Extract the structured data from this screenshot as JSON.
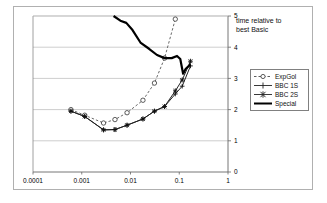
{
  "chart_title_line1": "time relative to",
  "chart_title_line2": "best Basic",
  "legend": {
    "items": [
      {
        "label": "ExpGol",
        "key": "dashed-circle-key"
      },
      {
        "label": "BBC 1S",
        "key": "solid-plus-key"
      },
      {
        "label": "BBC 2S",
        "key": "solid-star-key"
      },
      {
        "label": "Special",
        "key": "thick-solid-key"
      }
    ]
  },
  "axes": {
    "x_ticks": [
      "0.0001",
      "0.001",
      "0.01",
      "0.1",
      "1"
    ],
    "y_ticks": [
      "0",
      "1",
      "2",
      "3",
      "4",
      "5"
    ]
  },
  "chart_data": {
    "type": "line",
    "title": "time relative to best Basic",
    "xlabel": "",
    "ylabel": "",
    "xscale": "log",
    "xlim": [
      0.0001,
      1
    ],
    "ylim": [
      0,
      5
    ],
    "grid": true,
    "legend_position": "right",
    "xticks": [
      0.0001,
      0.001,
      0.01,
      0.1,
      1
    ],
    "yticks": [
      0,
      1,
      2,
      3,
      4,
      5
    ],
    "series": [
      {
        "name": "ExpGol",
        "style": "dashed",
        "marker": "circle",
        "points": [
          {
            "x": 0.0006,
            "y": 2.0
          },
          {
            "x": 0.00115,
            "y": 1.82
          },
          {
            "x": 0.0028,
            "y": 1.57
          },
          {
            "x": 0.0048,
            "y": 1.68
          },
          {
            "x": 0.0085,
            "y": 1.9
          },
          {
            "x": 0.018,
            "y": 2.3
          },
          {
            "x": 0.031,
            "y": 2.85
          },
          {
            "x": 0.05,
            "y": 3.65
          },
          {
            "x": 0.083,
            "y": 4.9
          }
        ]
      },
      {
        "name": "BBC 1S",
        "style": "solid",
        "marker": "plus",
        "points": [
          {
            "x": 0.0006,
            "y": 1.95
          },
          {
            "x": 0.00115,
            "y": 1.78
          },
          {
            "x": 0.0028,
            "y": 1.35
          },
          {
            "x": 0.0048,
            "y": 1.36
          },
          {
            "x": 0.0085,
            "y": 1.5
          },
          {
            "x": 0.018,
            "y": 1.7
          },
          {
            "x": 0.031,
            "y": 1.95
          },
          {
            "x": 0.05,
            "y": 2.1
          },
          {
            "x": 0.083,
            "y": 2.5
          },
          {
            "x": 0.115,
            "y": 2.75
          },
          {
            "x": 0.17,
            "y": 3.4
          }
        ]
      },
      {
        "name": "BBC 2S",
        "style": "solid",
        "marker": "star",
        "points": [
          {
            "x": 0.0006,
            "y": 1.95
          },
          {
            "x": 0.00115,
            "y": 1.78
          },
          {
            "x": 0.0028,
            "y": 1.35
          },
          {
            "x": 0.0048,
            "y": 1.36
          },
          {
            "x": 0.0085,
            "y": 1.5
          },
          {
            "x": 0.018,
            "y": 1.7
          },
          {
            "x": 0.031,
            "y": 1.95
          },
          {
            "x": 0.05,
            "y": 2.1
          },
          {
            "x": 0.083,
            "y": 2.6
          },
          {
            "x": 0.115,
            "y": 2.95
          },
          {
            "x": 0.17,
            "y": 3.55
          }
        ]
      },
      {
        "name": "Special",
        "style": "thick-solid",
        "marker": "none",
        "points": [
          {
            "x": 0.0045,
            "y": 5.0
          },
          {
            "x": 0.0062,
            "y": 4.85
          },
          {
            "x": 0.0082,
            "y": 4.78
          },
          {
            "x": 0.011,
            "y": 4.55
          },
          {
            "x": 0.016,
            "y": 4.15
          },
          {
            "x": 0.024,
            "y": 3.95
          },
          {
            "x": 0.035,
            "y": 3.75
          },
          {
            "x": 0.05,
            "y": 3.65
          },
          {
            "x": 0.07,
            "y": 3.65
          },
          {
            "x": 0.09,
            "y": 3.72
          },
          {
            "x": 0.105,
            "y": 3.62
          },
          {
            "x": 0.12,
            "y": 3.15
          },
          {
            "x": 0.135,
            "y": 3.3
          },
          {
            "x": 0.17,
            "y": 3.45
          }
        ]
      }
    ]
  }
}
